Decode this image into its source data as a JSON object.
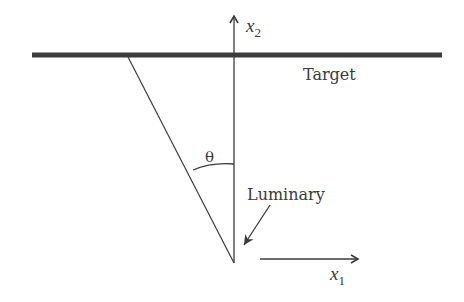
{
  "diagram": {
    "labels": {
      "x2_axis": "x",
      "x2_sub": "2",
      "x1_axis": "x",
      "x1_sub": "1",
      "target": "Target",
      "luminary": "Luminary",
      "angle": "θ"
    },
    "colors": {
      "ink": "#3a3a3a",
      "target_bar": "#3c3c3c",
      "background": "#ffffff"
    }
  }
}
